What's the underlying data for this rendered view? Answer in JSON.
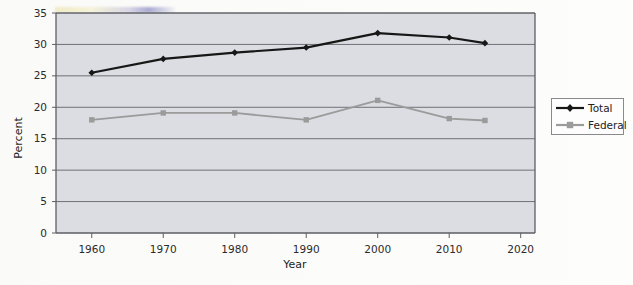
{
  "chart_data": {
    "type": "line",
    "title": "",
    "subtitle": "",
    "xlabel": "Year",
    "ylabel": "Percent",
    "x": [
      1960,
      1970,
      1980,
      1990,
      2000,
      2010,
      2015
    ],
    "xlim": [
      1955,
      2022
    ],
    "ylim": [
      0,
      35
    ],
    "xticks": [
      1960,
      1970,
      1980,
      1990,
      2000,
      2010,
      2020
    ],
    "xtick_labels": [
      "1960",
      "1970",
      "1980",
      "1990",
      "2000",
      "2010",
      "2020"
    ],
    "yticks": [
      0,
      5,
      10,
      15,
      20,
      25,
      30,
      35
    ],
    "ytick_labels": [
      "0",
      "5",
      "10",
      "15",
      "20",
      "25",
      "30",
      "35"
    ],
    "grid": "horizontal",
    "legend_position": "right",
    "series": [
      {
        "name": "Total",
        "color": "#171717",
        "marker": "diamond",
        "values": [
          25.5,
          27.7,
          28.7,
          29.5,
          31.8,
          31.1,
          30.2
        ]
      },
      {
        "name": "Federal",
        "color": "#9b9b9b",
        "marker": "square",
        "values": [
          18.0,
          19.1,
          19.1,
          18.0,
          21.1,
          18.2,
          17.9
        ]
      }
    ]
  },
  "legend": {
    "entries": [
      {
        "label": "Total"
      },
      {
        "label": "Federal"
      }
    ]
  },
  "colors": {
    "total_series": "#171717",
    "federal_series": "#9b9b9b",
    "plot_background": "#dcdde2",
    "gridline": "#6f7077",
    "axis": "#5d5e64",
    "page_background": "#fefefe"
  }
}
